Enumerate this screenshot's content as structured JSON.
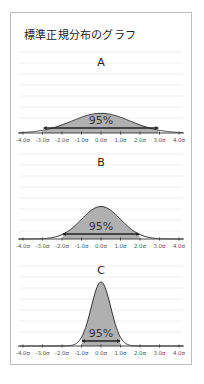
{
  "title": "標準正規分布のグラフ",
  "chart_data": [
    {
      "type": "area",
      "panel": "A",
      "title": "A",
      "distribution": "normal",
      "mean": 0,
      "sd": 1.5,
      "shaded_label": "95%",
      "interval": [
        -2.94,
        2.94
      ],
      "xlabel": "",
      "ylabel": "",
      "xlim": [
        -4.0,
        4.0
      ],
      "x_tick_labels": [
        "-4.0σ",
        "-3.0σ",
        "-2.0σ",
        "-1.0σ",
        "0.0σ",
        "1.0σ",
        "2.0σ",
        "3.0σ",
        "4.0σ"
      ],
      "grid": true
    },
    {
      "type": "area",
      "panel": "B",
      "title": "B",
      "distribution": "normal",
      "mean": 0,
      "sd": 1.0,
      "shaded_label": "95%",
      "interval": [
        -1.96,
        1.96
      ],
      "xlim": [
        -4.0,
        4.0
      ],
      "x_tick_labels": [
        "-4.0σ",
        "-3.0σ",
        "-2.0σ",
        "-1.0σ",
        "0.0σ",
        "1.0σ",
        "2.0σ",
        "3.0σ",
        "4.0σ"
      ],
      "grid": true
    },
    {
      "type": "area",
      "panel": "C",
      "title": "C",
      "distribution": "normal",
      "mean": 0,
      "sd": 0.5,
      "shaded_label": "95%",
      "interval": [
        -0.98,
        0.98
      ],
      "xlim": [
        -4.0,
        4.0
      ],
      "x_tick_labels": [
        "-4.0σ",
        "-3.0σ",
        "-2.0σ",
        "-1.0σ",
        "0.0σ",
        "1.0σ",
        "2.0σ",
        "3.0σ",
        "4.0σ"
      ],
      "grid": true
    }
  ],
  "colors": {
    "fill": "#b0b0b0",
    "curve": "#333333",
    "grid": "#eeeeee",
    "axis": "#444444",
    "frame": "#bdbdbd"
  }
}
